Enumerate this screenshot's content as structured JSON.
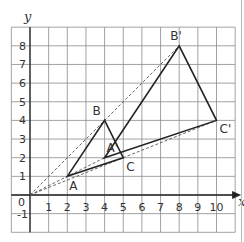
{
  "diagram": {
    "type": "coordinate-grid-enlargement",
    "axes": {
      "x_label": "x",
      "y_label": "y",
      "origin_label": "0",
      "x_ticks": [
        "1",
        "2",
        "3",
        "4",
        "5",
        "6",
        "7",
        "8",
        "9",
        "10"
      ],
      "y_ticks": [
        "1",
        "2",
        "3",
        "4",
        "5",
        "6",
        "7",
        "8"
      ],
      "y_negative_tick": "-1",
      "x_range": [
        -1,
        11
      ],
      "y_range": [
        -2,
        9
      ]
    },
    "center_of_enlargement": {
      "x": 0,
      "y": 0
    },
    "triangle_original": {
      "A": {
        "label": "A",
        "x": 2,
        "y": 1
      },
      "B": {
        "label": "B",
        "x": 4,
        "y": 4
      },
      "C": {
        "label": "C",
        "x": 5,
        "y": 2
      }
    },
    "triangle_image": {
      "A'": {
        "label": "A'",
        "x": 4,
        "y": 2
      },
      "B'": {
        "label": "B'",
        "x": 8,
        "y": 8
      },
      "C'": {
        "label": "C'",
        "x": 10,
        "y": 4
      }
    },
    "colors": {
      "grid": "#8a8a8a",
      "axis": "#222222",
      "triangle": "#222222",
      "ray": "#555555"
    }
  }
}
